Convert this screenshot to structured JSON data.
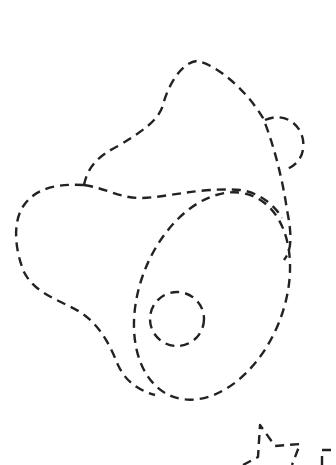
{
  "drawing": {
    "subject": "ham-leg-outline",
    "style": "dashed-line coloring outline",
    "stroke_color": "#222222",
    "background_color": "#ffffff",
    "parts": [
      {
        "name": "upper-meat-lobe",
        "type": "path"
      },
      {
        "name": "small-bump-right",
        "type": "path"
      },
      {
        "name": "main-body-outline",
        "type": "path"
      },
      {
        "name": "cut-face-ellipse",
        "type": "ellipse"
      },
      {
        "name": "bone-circle",
        "type": "circle"
      },
      {
        "name": "partial-shape-bottom-right",
        "type": "path"
      }
    ]
  }
}
